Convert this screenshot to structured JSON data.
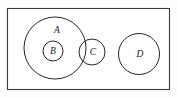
{
  "figure": {
    "kind": "set-diagram",
    "width": 178,
    "height": 98,
    "background_color": "#fdfdfd",
    "line_color": "#272727",
    "label_color": "#1c1c1c"
  },
  "universe": {
    "name": "universal-set-rectangle",
    "x": 7,
    "y": 8,
    "width": 163,
    "height": 82,
    "fill": "#ffffff",
    "stroke": "#3a3a3a"
  },
  "sets": [
    {
      "id": "A",
      "label": "A",
      "cx": 55,
      "cy": 48,
      "r": 31,
      "label_x": 57,
      "label_y": 31
    },
    {
      "id": "B",
      "label": "B",
      "cx": 53,
      "cy": 51,
      "r": 10,
      "label_x": 53,
      "label_y": 51
    },
    {
      "id": "C",
      "label": "C",
      "cx": 92,
      "cy": 52,
      "r": 13,
      "label_x": 93,
      "label_y": 52
    },
    {
      "id": "D",
      "label": "D",
      "cx": 139,
      "cy": 54,
      "r": 20.5,
      "label_x": 140,
      "label_y": 54
    }
  ]
}
